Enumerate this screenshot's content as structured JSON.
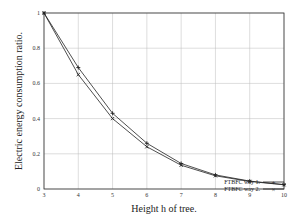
{
  "chart_data": {
    "type": "line",
    "title": "",
    "xlabel": "Height h of tree.",
    "ylabel": "Electric energy consumption ratio.",
    "x": [
      3,
      4,
      5,
      6,
      7,
      8,
      9,
      10
    ],
    "xticks": [
      "3",
      "4",
      "5",
      "6",
      "7",
      "8",
      "9",
      "10"
    ],
    "yticks": [
      "0",
      "0.2",
      "0.4",
      "0.6",
      "0.8",
      "1"
    ],
    "xlim": [
      3,
      10
    ],
    "ylim": [
      0,
      1
    ],
    "grid": true,
    "legend_position": "outside-bottom-right",
    "series": [
      {
        "name": "FTBFC way 1.",
        "marker": "plus",
        "values": [
          1.0,
          0.69,
          0.43,
          0.26,
          0.145,
          0.08,
          0.045,
          0.025
        ]
      },
      {
        "name": "FTBFC way 2.",
        "marker": "x",
        "values": [
          1.0,
          0.65,
          0.4,
          0.24,
          0.135,
          0.075,
          0.043,
          0.024
        ]
      }
    ]
  }
}
